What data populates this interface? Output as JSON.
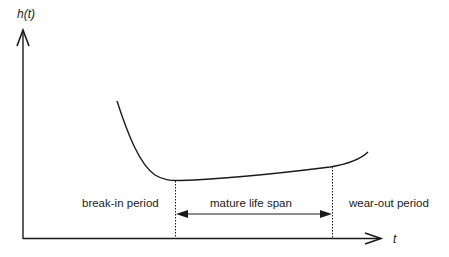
{
  "diagram": {
    "y_axis_label": "h(t)",
    "x_axis_label": "t",
    "regions": [
      {
        "id": "break_in",
        "label": "break-in period"
      },
      {
        "id": "mature",
        "label": "mature life span"
      },
      {
        "id": "wear_out",
        "label": "wear-out period"
      }
    ],
    "colors": {
      "line": "#1a1a1a",
      "background": "#ffffff"
    }
  }
}
